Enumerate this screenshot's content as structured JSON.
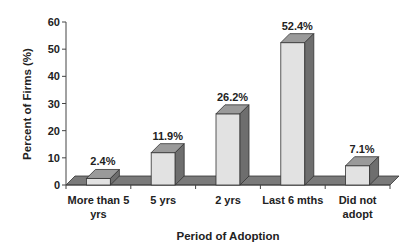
{
  "chart_data": {
    "type": "bar",
    "style": "3d-column",
    "title": "",
    "xlabel": "Period of Adoption",
    "ylabel": "Percent of Firms (%)",
    "categories": [
      "More than 5 yrs",
      "5 yrs",
      "2 yrs",
      "Last 6 mths",
      "Did not adopt"
    ],
    "category_lines": [
      [
        "More than 5",
        "yrs"
      ],
      [
        "5 yrs"
      ],
      [
        "2 yrs"
      ],
      [
        "Last 6 mths"
      ],
      [
        "Did not",
        "adopt"
      ]
    ],
    "values": [
      2.4,
      11.9,
      26.2,
      52.4,
      7.1
    ],
    "data_labels": [
      "2.4%",
      "11.9%",
      "26.2%",
      "52.4%",
      "7.1%"
    ],
    "ylim": [
      0,
      60
    ],
    "yticks": [
      0,
      10,
      20,
      30,
      40,
      50,
      60
    ],
    "grid": false,
    "legend": null,
    "colors": {
      "bar_front": "#e2e2e2",
      "bar_top": "#9a9a9a",
      "bar_side": "#6e6e6e",
      "floor": "#7a7a7a",
      "axis": "#444444",
      "text": "#222222"
    }
  }
}
